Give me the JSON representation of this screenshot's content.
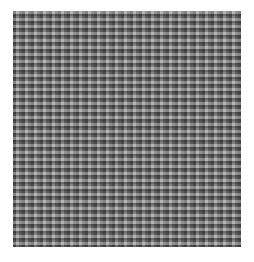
{
  "page": {
    "background_color": "#ffffff",
    "width": 254,
    "height": 262
  },
  "figure": {
    "name": "grayscale-noise-texture",
    "x": 13,
    "y": 11,
    "width": 228,
    "height": 236,
    "mean_gray": "#808080",
    "dark_tone": "#2a2a2a",
    "light_tone": "#d8d8d8",
    "border_color": "#9a9a9a"
  },
  "caption": {
    "text": "",
    "note": "clipped at page edge",
    "color": "#111111"
  },
  "chart_data": {
    "type": "heatmap",
    "title": "",
    "xlabel": "",
    "ylabel": "",
    "grid": false,
    "legend": "none",
    "colormap": "grayscale",
    "value_range": [
      0,
      255
    ],
    "display_range": [
      42,
      216
    ],
    "mean": 128,
    "std": 46,
    "rows": 114,
    "cols": 114,
    "cell_size_px": 2
  }
}
